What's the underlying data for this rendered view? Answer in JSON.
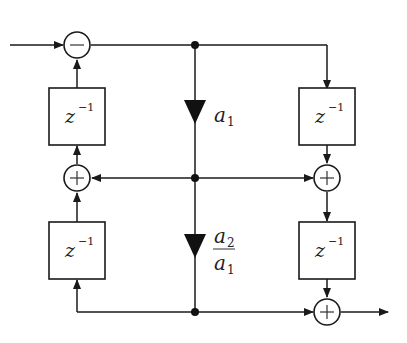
{
  "diagram": {
    "type": "lattice filter signal-flow block diagram",
    "delay_blocks": [
      {
        "id": "delay-left-top",
        "base": "z",
        "exponent": "−1"
      },
      {
        "id": "delay-left-bottom",
        "base": "z",
        "exponent": "−1"
      },
      {
        "id": "delay-right-top",
        "base": "z",
        "exponent": "−1"
      },
      {
        "id": "delay-right-bottom",
        "base": "z",
        "exponent": "−1"
      }
    ],
    "summers": [
      {
        "id": "subtractor-input",
        "symbol": "−"
      },
      {
        "id": "adder-left-middle",
        "symbol": "+"
      },
      {
        "id": "adder-right-middle",
        "symbol": "+"
      },
      {
        "id": "adder-output",
        "symbol": "+"
      }
    ],
    "gains": [
      {
        "id": "gain-a1",
        "label": "a",
        "subscript": "1"
      },
      {
        "id": "gain-a2-over-a1",
        "numerator": "a",
        "numerator_sub": "2",
        "denominator": "a",
        "denominator_sub": "1"
      }
    ],
    "colors": {
      "line": "#1a1a1a",
      "background": "#ffffff"
    }
  }
}
